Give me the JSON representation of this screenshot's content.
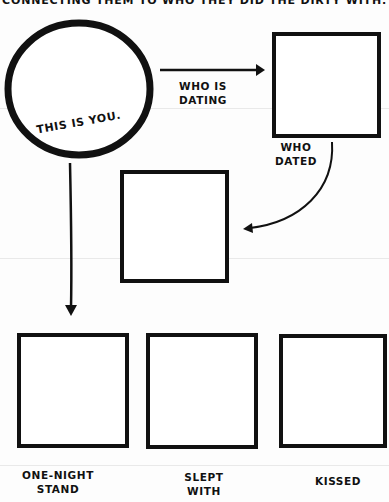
{
  "header": {
    "text": "CONNECTING THEM TO WHO THEY DID THE DIRTY WITH."
  },
  "you": {
    "label": "THIS IS YOU."
  },
  "arrows": {
    "dating_label_line1": "WHO IS",
    "dating_label_line2": "DATING"
  },
  "boxes": {
    "dating": {
      "label": ""
    },
    "dated": {
      "label_line1": "WHO",
      "label_line2": "DATED"
    },
    "middle": {
      "label": ""
    },
    "one_night": {
      "label_line1": "ONE-NIGHT",
      "label_line2": "STAND"
    },
    "slept": {
      "label_line1": "SLEPT",
      "label_line2": "WITH"
    },
    "kissed": {
      "label": "KISSED"
    }
  },
  "colors": {
    "ink": "#111111",
    "paper": "#fdfdfd"
  }
}
